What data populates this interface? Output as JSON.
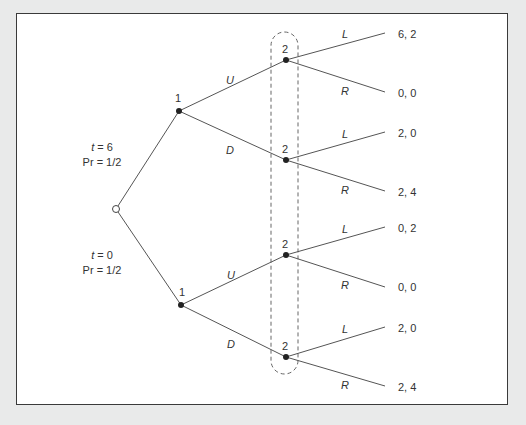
{
  "diagram": {
    "type": "extensive-form game tree",
    "chance_node": {
      "branches": [
        {
          "type_label_var": "t",
          "type_label_eq": " = 6",
          "prob_label": "Pr = 1/2"
        },
        {
          "type_label_var": "t",
          "type_label_eq": " = 0",
          "prob_label": "Pr = 1/2"
        }
      ]
    },
    "player1_nodes": [
      {
        "player": "1",
        "actions": [
          "U",
          "D"
        ]
      },
      {
        "player": "1",
        "actions": [
          "U",
          "D"
        ]
      }
    ],
    "player2_nodes": [
      {
        "player": "2",
        "actions": [
          "L",
          "R"
        ],
        "payoffs": [
          "6, 2",
          "0, 0"
        ]
      },
      {
        "player": "2",
        "actions": [
          "L",
          "R"
        ],
        "payoffs": [
          "2, 0",
          "2, 4"
        ]
      },
      {
        "player": "2",
        "actions": [
          "L",
          "R"
        ],
        "payoffs": [
          "0, 2",
          "0, 0"
        ]
      },
      {
        "player": "2",
        "actions": [
          "L",
          "R"
        ],
        "payoffs": [
          "2, 0",
          "2, 4"
        ]
      }
    ],
    "information_set": {
      "player": "2",
      "style": "dashed"
    },
    "colors": {
      "line": "#555555",
      "frame": "#3a3a3a",
      "background": "#e9eaea",
      "panel": "#ffffff",
      "node": "#222222"
    }
  }
}
